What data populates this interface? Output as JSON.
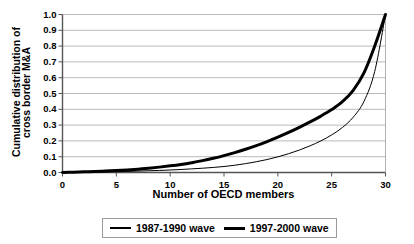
{
  "chart_data": {
    "type": "line",
    "title": "",
    "xlabel": "Number of OECD members",
    "ylabel_line1": "Cumulative distribution of",
    "ylabel_line2": "cross border M&A",
    "xlim": [
      0,
      30
    ],
    "ylim": [
      0,
      1.0
    ],
    "xticks": [
      0,
      5,
      10,
      15,
      20,
      25,
      30
    ],
    "xtick_labels": [
      "0",
      "5",
      "10",
      "15",
      "20",
      "25",
      "30"
    ],
    "yticks": [
      0.0,
      0.1,
      0.2,
      0.3,
      0.4,
      0.5,
      0.6,
      0.7,
      0.8,
      0.9,
      1.0
    ],
    "ytick_labels": [
      "0.0",
      "0.1",
      "0.2",
      "0.3",
      "0.4",
      "0.5",
      "0.6",
      "0.7",
      "0.8",
      "0.9",
      "1.0"
    ],
    "grid": "horizontal",
    "legend_position": "below",
    "x": [
      0,
      1,
      2,
      3,
      4,
      5,
      6,
      7,
      8,
      9,
      10,
      11,
      12,
      13,
      14,
      15,
      16,
      17,
      18,
      19,
      20,
      21,
      22,
      23,
      24,
      25,
      26,
      27,
      28,
      29,
      30
    ],
    "series": [
      {
        "name": "1987-1990 wave",
        "line_width": 1,
        "color": "#000000",
        "values": [
          0.0,
          0.001,
          0.002,
          0.003,
          0.004,
          0.005,
          0.007,
          0.009,
          0.011,
          0.013,
          0.016,
          0.019,
          0.023,
          0.027,
          0.032,
          0.038,
          0.046,
          0.056,
          0.068,
          0.082,
          0.099,
          0.119,
          0.142,
          0.169,
          0.2,
          0.238,
          0.285,
          0.35,
          0.45,
          0.64,
          1.0
        ]
      },
      {
        "name": "1997-2000 wave",
        "line_width": 3,
        "color": "#000000",
        "values": [
          0.0,
          0.002,
          0.004,
          0.006,
          0.009,
          0.012,
          0.016,
          0.021,
          0.027,
          0.034,
          0.042,
          0.051,
          0.062,
          0.075,
          0.09,
          0.107,
          0.126,
          0.147,
          0.17,
          0.196,
          0.224,
          0.254,
          0.286,
          0.32,
          0.357,
          0.398,
          0.448,
          0.52,
          0.63,
          0.8,
          1.0
        ]
      }
    ]
  },
  "legend": {
    "entries": [
      {
        "label": "1987-1990 wave"
      },
      {
        "label": "1997-2000 wave"
      }
    ]
  }
}
